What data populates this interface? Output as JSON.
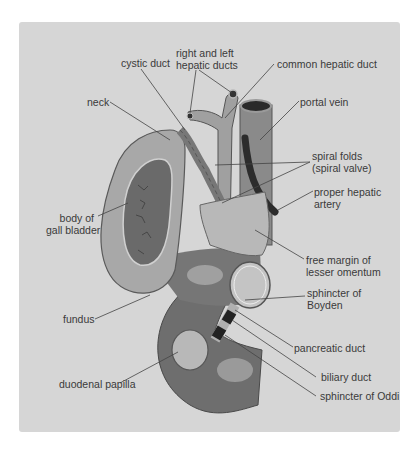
{
  "diagram": {
    "colors": {
      "background": "#d6d6d6",
      "tissue_light": "#b4b4b4",
      "tissue_mid": "#8a8a8a",
      "tissue_dark": "#5e5e5e",
      "duodenum": "#6e6e6e",
      "text": "#3a3a3a",
      "leader": "#444444"
    },
    "labels": {
      "cystic_duct": "cystic duct",
      "hepatic_ducts_1": "right and left",
      "hepatic_ducts_2": "hepatic ducts",
      "common_hepatic_duct": "common hepatic duct",
      "neck": "neck",
      "portal_vein": "portal vein",
      "spiral_folds_1": "spiral folds",
      "spiral_folds_2": "(spiral valve)",
      "proper_hepatic_1": "proper hepatic",
      "proper_hepatic_2": "artery",
      "body_1": "body of",
      "body_2": "gall bladder",
      "free_margin_1": "free margin of",
      "free_margin_2": "lesser omentum",
      "boyden_1": "sphincter of",
      "boyden_2": "Boyden",
      "fundus": "fundus",
      "pancreatic_duct": "pancreatic duct",
      "duodenal_papilla": "duodenal papilla",
      "biliary_duct": "biliary duct",
      "sphincter_oddi": "sphincter of Oddi"
    }
  }
}
